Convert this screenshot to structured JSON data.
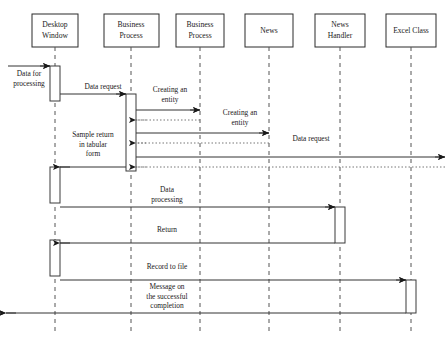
{
  "diagram": {
    "width": 447,
    "height": 340,
    "background_color": "#ffffff",
    "line_color": "#333333",
    "dotted_color": "#777777",
    "lifeline_dash_color": "#555555"
  },
  "lifelines": [
    {
      "id": "desktop-window",
      "label_line1": "Desktop",
      "label_line2": "Window",
      "x": 55,
      "box_left": 32,
      "box_top": 14,
      "box_width": 46,
      "box_height": 33
    },
    {
      "id": "business-process-1",
      "label_line1": "Business",
      "label_line2": "Process",
      "x": 131,
      "box_left": 104,
      "box_top": 14,
      "box_width": 55,
      "box_height": 33
    },
    {
      "id": "business-process-2",
      "label_line1": "Business",
      "label_line2": "Process",
      "x": 200,
      "box_left": 176,
      "box_top": 14,
      "box_width": 48,
      "box_height": 33
    },
    {
      "id": "news",
      "label_line1": "News",
      "label_line2": "",
      "x": 269,
      "box_left": 245,
      "box_top": 14,
      "box_width": 48,
      "box_height": 33
    },
    {
      "id": "news-handler",
      "label_line1": "News",
      "label_line2": "Handler",
      "x": 340,
      "box_left": 315,
      "box_top": 14,
      "box_width": 50,
      "box_height": 33
    },
    {
      "id": "excel-class",
      "label_line1": "Excel Class",
      "label_line2": "",
      "x": 411,
      "box_left": 386,
      "box_top": 14,
      "box_width": 50,
      "box_height": 33
    }
  ],
  "activations": [
    {
      "id": "act-desktop-1",
      "lifeline": "desktop-window",
      "x": 50,
      "y": 66,
      "width": 10,
      "height": 35
    },
    {
      "id": "act-desktop-2",
      "lifeline": "desktop-window",
      "x": 50,
      "y": 167,
      "width": 10,
      "height": 36
    },
    {
      "id": "act-desktop-3",
      "lifeline": "desktop-window",
      "x": 50,
      "y": 240,
      "width": 10,
      "height": 36
    },
    {
      "id": "act-business-1",
      "lifeline": "business-process-1",
      "x": 126,
      "y": 94,
      "width": 10,
      "height": 77
    },
    {
      "id": "act-news-handler",
      "lifeline": "news-handler",
      "x": 335,
      "y": 207,
      "width": 10,
      "height": 36
    },
    {
      "id": "act-excel",
      "lifeline": "excel-class",
      "x": 406,
      "y": 280,
      "width": 10,
      "height": 33
    }
  ],
  "messages": [
    {
      "id": "msg-data-for-processing",
      "label": "Data for\nprocessing",
      "label_lines": [
        "Data for",
        "processing"
      ],
      "style": "solid",
      "from_x": 8,
      "to_x": 50,
      "y": 66,
      "label_x": 29,
      "label_y": 76,
      "direction": "right"
    },
    {
      "id": "msg-data-request-1",
      "label": "Data request",
      "label_lines": [
        "Data request"
      ],
      "style": "solid",
      "from_x": 60,
      "to_x": 126,
      "y": 94,
      "label_x": 103,
      "label_y": 89,
      "direction": "right"
    },
    {
      "id": "msg-creating-entity-1",
      "label": "Creating an\nentity",
      "label_lines": [
        "Creating an",
        "entity"
      ],
      "style": "solid",
      "from_x": 136,
      "to_x": 200,
      "y": 110,
      "label_x": 170,
      "label_y": 92,
      "direction": "right"
    },
    {
      "id": "msg-return-entity-1",
      "label": "",
      "label_lines": [],
      "style": "dotted",
      "from_x": 200,
      "to_x": 136,
      "y": 120,
      "label_x": 0,
      "label_y": 0,
      "direction": "left"
    },
    {
      "id": "msg-creating-entity-2",
      "label": "Creating an\nentity",
      "label_lines": [
        "Creating an",
        "entity"
      ],
      "style": "solid",
      "from_x": 136,
      "to_x": 269,
      "y": 133,
      "label_x": 240,
      "label_y": 115,
      "direction": "right"
    },
    {
      "id": "msg-return-entity-2",
      "label": "",
      "label_lines": [],
      "style": "dotted",
      "from_x": 269,
      "to_x": 136,
      "y": 143,
      "label_x": 0,
      "label_y": 0,
      "direction": "left"
    },
    {
      "id": "msg-data-request-2",
      "label": "Data request",
      "label_lines": [
        "Data request"
      ],
      "style": "solid",
      "from_x": 136,
      "to_x": 445,
      "y": 157,
      "label_x": 311,
      "label_y": 141,
      "direction": "right"
    },
    {
      "id": "msg-return-data-request-2",
      "label": "",
      "label_lines": [],
      "style": "dotted",
      "from_x": 445,
      "to_x": 136,
      "y": 167,
      "label_x": 0,
      "label_y": 0,
      "direction": "left"
    },
    {
      "id": "msg-sample-return",
      "label": "Sample return\nin tabular\nform",
      "label_lines": [
        "Sample return",
        "in tabular",
        "form"
      ],
      "style": "solid",
      "from_x": 126,
      "to_x": 60,
      "y": 167,
      "label_x": 93,
      "label_y": 137,
      "direction": "left"
    },
    {
      "id": "msg-data-processing",
      "label": "Data\nprocessing",
      "label_lines": [
        "Data",
        "processing"
      ],
      "style": "solid",
      "from_x": 60,
      "to_x": 335,
      "y": 207,
      "label_x": 167,
      "label_y": 192,
      "direction": "right"
    },
    {
      "id": "msg-return",
      "label": "Return",
      "label_lines": [
        "Return"
      ],
      "style": "solid",
      "from_x": 335,
      "to_x": 60,
      "y": 243,
      "label_x": 167,
      "label_y": 232,
      "direction": "left"
    },
    {
      "id": "msg-record-to-file",
      "label": "Record to file",
      "label_lines": [
        "Record to file"
      ],
      "style": "solid",
      "from_x": 60,
      "to_x": 406,
      "y": 280,
      "label_x": 167,
      "label_y": 269,
      "direction": "right"
    },
    {
      "id": "msg-message-success",
      "label": "Message on\nthe successful\ncompletion",
      "label_lines": [
        "Message on",
        "the successful",
        "completion"
      ],
      "style": "solid",
      "from_x": 406,
      "to_x": 6,
      "y": 313,
      "label_x": 167,
      "label_y": 289,
      "direction": "left"
    }
  ]
}
